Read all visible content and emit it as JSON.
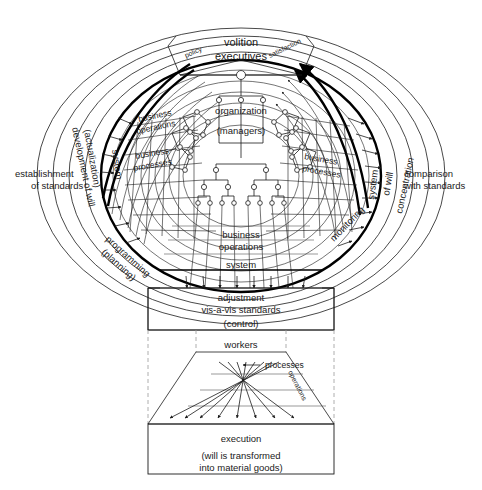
{
  "figure": {
    "background": "#ffffff",
    "stroke": "#1a1a1a"
  },
  "outer_labels": {
    "left": "establishment\nof standards",
    "left_line1": "establishment",
    "left_line2": "of standards",
    "right_line1": "comparison",
    "right_line2": "with standards"
  },
  "rings": {
    "left_outer": "development of will",
    "left_outer_sub": "(actualization)",
    "left_inner": "system",
    "right_outer": "concentration",
    "right_outer_sub": "of will",
    "right_inner": "system",
    "bottom_left": "programming",
    "bottom_left_sub": "(planning)",
    "bottom_right": "monitoring"
  },
  "top": {
    "left_segment": "policy",
    "right_segment": "satisfaction",
    "center_line1": "volition",
    "center_line2": "executives"
  },
  "center": {
    "organization": "organization",
    "managers": "(managers)"
  },
  "quadrant_labels": {
    "upper_left_line1": "business",
    "upper_left_line2": "operations",
    "mid_left_line1": "business",
    "mid_left_line2": "processes",
    "mid_right_line1": "business",
    "mid_right_line2": "processes",
    "lower_center_line1": "business",
    "lower_center_line2": "operations",
    "lower_center_line3": "system"
  },
  "control_box": {
    "line1": "adjustment",
    "line2": "vis-a-vis standards",
    "line3": "(control)"
  },
  "workers": {
    "label": "workers",
    "processes": "processes",
    "operations": "operations"
  },
  "execution_box": {
    "line1": "execution",
    "line2": "(will is transformed",
    "line3": "into material goods)"
  }
}
